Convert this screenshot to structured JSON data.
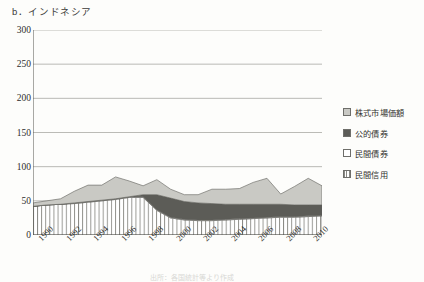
{
  "panel": {
    "title": "b．インドネシア"
  },
  "caption": {
    "text": "出所：各国統計等より作成"
  },
  "legend": {
    "position": "right",
    "items": [
      {
        "label": "株式市場価額",
        "fill": "#c9c9c4",
        "pattern": "solid",
        "swatch_name": "equity-market-cap"
      },
      {
        "label": "公的債券",
        "fill": "#5c5c57",
        "pattern": "solid",
        "swatch_name": "public-bonds"
      },
      {
        "label": "民間債券",
        "fill": "#ffffff",
        "pattern": "solid",
        "swatch_name": "private-bonds"
      },
      {
        "label": "民間信用",
        "fill": "#ffffff",
        "pattern": "vertical",
        "swatch_name": "private-credit"
      }
    ]
  },
  "chart_data": {
    "type": "area",
    "stacked": true,
    "title": "b．インドネシア",
    "xlabel": "",
    "ylabel": "",
    "ylim": [
      0,
      300
    ],
    "yticks": [
      0,
      50,
      100,
      150,
      200,
      250,
      300
    ],
    "grid": true,
    "xlim": [
      1990,
      2011
    ],
    "x": [
      1990,
      1991,
      1992,
      1993,
      1994,
      1995,
      1996,
      1997,
      1998,
      1999,
      2000,
      2001,
      2002,
      2003,
      2004,
      2005,
      2006,
      2007,
      2008,
      2009,
      2010,
      2011
    ],
    "xticks": [
      1990,
      1992,
      1994,
      1996,
      1998,
      2000,
      2002,
      2004,
      2006,
      2008,
      2010
    ],
    "xticklabels": [
      "1990",
      "1992",
      "1994",
      "1996",
      "1998",
      "2000",
      "2002",
      "2004",
      "2006",
      "2008",
      "2010"
    ],
    "series": [
      {
        "name": "民間信用",
        "fill": "#ffffff",
        "pattern": "vertical",
        "values": [
          42,
          44,
          45,
          46,
          48,
          50,
          52,
          55,
          55,
          36,
          25,
          22,
          21,
          21,
          22,
          23,
          24,
          25,
          26,
          26,
          27,
          28
        ]
      },
      {
        "name": "民間債券",
        "fill": "#ffffff",
        "pattern": "solid",
        "values": [
          0,
          0,
          0,
          1,
          1,
          1,
          1,
          1,
          1,
          1,
          1,
          1,
          1,
          1,
          1,
          1,
          1,
          1,
          1,
          1,
          1,
          1
        ]
      },
      {
        "name": "公的債券",
        "fill": "#5c5c57",
        "pattern": "solid",
        "values": [
          0,
          0,
          0,
          0,
          0,
          0,
          0,
          0,
          3,
          22,
          28,
          26,
          25,
          24,
          22,
          21,
          20,
          19,
          18,
          17,
          16,
          15
        ]
      },
      {
        "name": "株式市場価額",
        "fill": "#c9c9c4",
        "pattern": "solid",
        "values": [
          5,
          6,
          8,
          17,
          24,
          22,
          32,
          23,
          13,
          22,
          13,
          10,
          12,
          21,
          22,
          23,
          32,
          38,
          15,
          27,
          39,
          28
        ]
      }
    ],
    "totals": [
      47,
      50,
      53,
      64,
      73,
      73,
      85,
      79,
      72,
      81,
      67,
      59,
      59,
      67,
      67,
      68,
      77,
      83,
      60,
      71,
      83,
      72
    ]
  }
}
